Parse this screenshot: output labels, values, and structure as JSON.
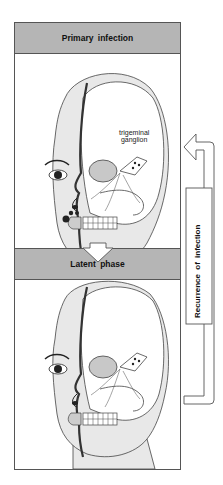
{
  "panels": {
    "primary": {
      "title": "Primary  infection"
    },
    "latent": {
      "title": "Latent  phase"
    }
  },
  "annotations": {
    "ganglion_line1": "trigeminal",
    "ganglion_line2": "ganglion"
  },
  "side_label": "Recurrence  of  infection",
  "colors": {
    "header_bg": "#b5b5b5",
    "skin": "#e8e8e8",
    "outline": "#444444",
    "lesion": "#222222"
  }
}
